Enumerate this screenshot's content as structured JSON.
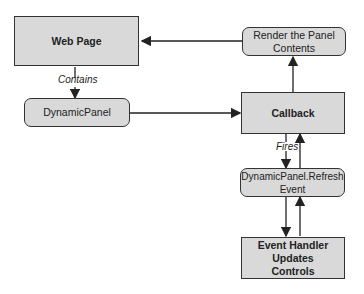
{
  "nodes": {
    "web_page": "Web Page",
    "dynamic_panel": "DynamicPanel",
    "render_contents": "Render the Panel Contents",
    "callback": "Callback",
    "refresh_event": "DynamicPanel.Refresh Event",
    "event_handler": "Event Handler Updates Controls"
  },
  "edges": {
    "contains": "Contains",
    "fires": "Fires"
  },
  "colors": {
    "box_fill": "#d9d9d9",
    "stroke": "#333333"
  }
}
